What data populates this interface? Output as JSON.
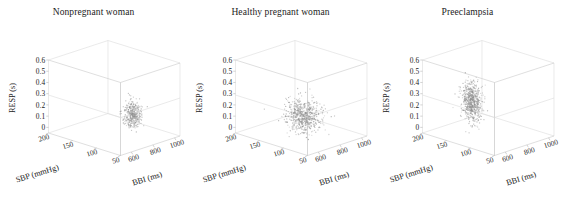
{
  "figure": {
    "panel_count": 3,
    "background": "#ffffff",
    "point_color": "#8e8e8e",
    "axis_color": "#c9c9c9"
  },
  "chart_data": [
    {
      "type": "scatter",
      "title": "Nonpregnant woman",
      "projection": "3d",
      "xlabel": "SBP (mmHg)",
      "ylabel": "BBI (ms)",
      "zlabel": "RESP (s)",
      "xticks": [
        200,
        150,
        100,
        50
      ],
      "yticks": [
        600,
        800,
        1000
      ],
      "zticks": [
        "0.6",
        "0.5",
        "0.4",
        "0.3",
        "0.2",
        "0.1",
        "0"
      ],
      "xlim": [
        50,
        200
      ],
      "ylim": [
        500,
        1050
      ],
      "zlim": [
        0,
        0.65
      ],
      "grid": false,
      "legend": "none",
      "cloud": {
        "description": "narrow vertical lattice slab, dense grid-like dots",
        "shape": "slab",
        "sbp_center": 110,
        "sbp_spread": 12,
        "bbi_center": 880,
        "bbi_spread": 55,
        "resp_center": 0.16,
        "resp_spread": 0.11,
        "n_points": 360
      }
    },
    {
      "type": "scatter",
      "title": "Healthy pregnant woman",
      "projection": "3d",
      "xlabel": "SBP (mmHg)",
      "ylabel": "BBI (ms)",
      "zlabel": "RESP (s)",
      "xticks": [
        200,
        150,
        100,
        50
      ],
      "yticks": [
        600,
        800,
        1000
      ],
      "zticks": [
        "0.6",
        "0.5",
        "0.4",
        "0.3",
        "0.2",
        "0.1",
        "0"
      ],
      "xlim": [
        50,
        200
      ],
      "ylim": [
        500,
        1050
      ],
      "zlim": [
        0,
        0.65
      ],
      "grid": false,
      "legend": "none",
      "cloud": {
        "description": "broad isotropic blob centred mid-box",
        "shape": "blob",
        "sbp_center": 118,
        "sbp_spread": 26,
        "bbi_center": 760,
        "bbi_spread": 95,
        "resp_center": 0.18,
        "resp_spread": 0.13,
        "n_points": 620
      }
    },
    {
      "type": "scatter",
      "title": "Preeclampsia",
      "projection": "3d",
      "xlabel": "SBP (mmHg)",
      "ylabel": "BBI (ms)",
      "zlabel": "RESP (s)",
      "xticks": [
        200,
        150,
        100,
        50
      ],
      "yticks": [
        600,
        800,
        1000
      ],
      "zticks": [
        "0.6",
        "0.5",
        "0.4",
        "0.3",
        "0.2",
        "0.1",
        "0"
      ],
      "xlim": [
        50,
        200
      ],
      "ylim": [
        500,
        1050
      ],
      "zlim": [
        0,
        0.65
      ],
      "grid": false,
      "legend": "none",
      "cloud": {
        "description": "tall narrow vertical column spanning nearly the full RESP range",
        "shape": "column",
        "sbp_center": 128,
        "sbp_spread": 16,
        "bbi_center": 640,
        "bbi_spread": 45,
        "resp_center": 0.33,
        "resp_spread": 0.16,
        "n_points": 620
      }
    }
  ]
}
